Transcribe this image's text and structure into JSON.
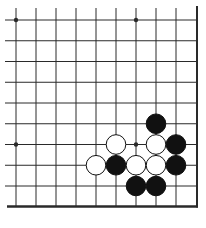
{
  "game": "go",
  "board_view": {
    "visible_columns": 9,
    "visible_rows": 9,
    "edges": [
      "bottom",
      "right"
    ],
    "star_points": [
      [
        0,
        0
      ],
      [
        6,
        0
      ],
      [
        0,
        6
      ],
      [
        6,
        6
      ]
    ]
  },
  "colors": {
    "background": "#ffffff",
    "line": "#2a2a2a",
    "black_stone": "#111111",
    "white_stone": "#ffffff",
    "stone_outline": "#111111"
  },
  "stones": [
    {
      "color": "black",
      "col": 7,
      "row": 5
    },
    {
      "color": "white",
      "col": 5,
      "row": 6
    },
    {
      "color": "white",
      "col": 7,
      "row": 6
    },
    {
      "color": "black",
      "col": 8,
      "row": 6
    },
    {
      "color": "white",
      "col": 4,
      "row": 7
    },
    {
      "color": "black",
      "col": 5,
      "row": 7
    },
    {
      "color": "white",
      "col": 6,
      "row": 7
    },
    {
      "color": "white",
      "col": 7,
      "row": 7
    },
    {
      "color": "black",
      "col": 8,
      "row": 7
    },
    {
      "color": "black",
      "col": 6,
      "row": 8
    },
    {
      "color": "black",
      "col": 7,
      "row": 8
    }
  ]
}
